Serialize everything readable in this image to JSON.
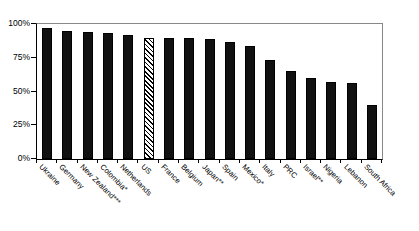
{
  "chart_data": {
    "type": "bar",
    "title": "",
    "xlabel": "",
    "ylabel": "",
    "ylim": [
      0,
      100
    ],
    "ytick_labels": [
      "0%",
      "25%",
      "50%",
      "75%",
      "100%"
    ],
    "ytick_values": [
      0,
      25,
      50,
      75,
      100
    ],
    "grid": false,
    "legend": "none",
    "categories": [
      "Ukraine",
      "Germany",
      "New Zealand***",
      "Colombia*",
      "Netherlands",
      "US",
      "France",
      "Belgium",
      "Japan**",
      "Spain",
      "Mexico*",
      "Italy",
      "PRC",
      "Israel**",
      "Nigeria",
      "Lebanon",
      "South Africa"
    ],
    "values": [
      97,
      95,
      94,
      93,
      92,
      90,
      90,
      90,
      89,
      87,
      84,
      73,
      65,
      60,
      57,
      56,
      40
    ],
    "highlighted_category": "US",
    "highlight_style": "diagonal-hatch",
    "bar_color": "#111111",
    "axis_color": "#000000"
  }
}
